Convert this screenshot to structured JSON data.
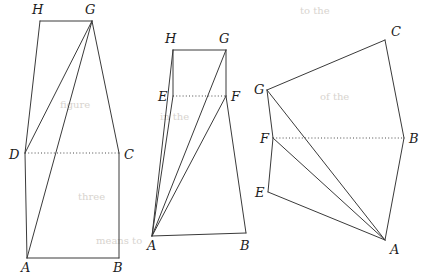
{
  "page": {
    "background_color": "#ffffff",
    "stroke_color": "#3a3a3a",
    "label_color": "#1c1c1c",
    "dotted_color": "#4a4a4a",
    "width": 424,
    "height": 276
  },
  "figures": [
    {
      "id": "figure-left",
      "name": "left-figure",
      "description": "Tall quadrilateral ABGH with horizontal dotted segment DC and diagonals from G",
      "vertices": [
        {
          "id": "H",
          "label": "H",
          "x": 40,
          "y": 21,
          "label_x": 32,
          "label_y": 14
        },
        {
          "id": "G",
          "label": "G",
          "x": 92,
          "y": 21,
          "label_x": 85,
          "label_y": 14
        },
        {
          "id": "D",
          "label": "D",
          "x": 25,
          "y": 153,
          "label_x": 9,
          "label_y": 159
        },
        {
          "id": "C",
          "label": "C",
          "x": 119,
          "y": 153,
          "label_x": 124,
          "label_y": 159
        },
        {
          "id": "A",
          "label": "A",
          "x": 27,
          "y": 258,
          "label_x": 21,
          "label_y": 272
        },
        {
          "id": "B",
          "label": "B",
          "x": 119,
          "y": 258,
          "label_x": 113,
          "label_y": 272
        }
      ],
      "solid_edges": [
        [
          "H",
          "G"
        ],
        [
          "H",
          "D"
        ],
        [
          "G",
          "C"
        ],
        [
          "G",
          "D"
        ],
        [
          "G",
          "A"
        ],
        [
          "D",
          "A"
        ],
        [
          "A",
          "B"
        ],
        [
          "B",
          "C"
        ]
      ],
      "dotted_edges": [
        [
          "D",
          "C"
        ]
      ]
    },
    {
      "id": "figure-middle",
      "name": "middle-figure",
      "description": "Quadrilateral with apex A at bottom-left, rectangle EFGH above, dotted segment EF",
      "vertices": [
        {
          "id": "H",
          "label": "H",
          "x": 173,
          "y": 50,
          "label_x": 165,
          "label_y": 43
        },
        {
          "id": "G",
          "label": "G",
          "x": 226,
          "y": 50,
          "label_x": 219,
          "label_y": 43
        },
        {
          "id": "E",
          "label": "E",
          "x": 173,
          "y": 96,
          "label_x": 158,
          "label_y": 101
        },
        {
          "id": "F",
          "label": "F",
          "x": 226,
          "y": 96,
          "label_x": 231,
          "label_y": 101
        },
        {
          "id": "A",
          "label": "A",
          "x": 152,
          "y": 236,
          "label_x": 147,
          "label_y": 250
        },
        {
          "id": "B",
          "label": "B",
          "x": 246,
          "y": 233,
          "label_x": 240,
          "label_y": 250
        }
      ],
      "solid_edges": [
        [
          "H",
          "G"
        ],
        [
          "H",
          "E"
        ],
        [
          "G",
          "F"
        ],
        [
          "G",
          "A"
        ],
        [
          "H",
          "A"
        ],
        [
          "E",
          "A"
        ],
        [
          "F",
          "A"
        ],
        [
          "F",
          "B"
        ],
        [
          "A",
          "B"
        ]
      ],
      "dotted_edges": [
        [
          "E",
          "F"
        ]
      ]
    },
    {
      "id": "figure-right",
      "name": "right-figure",
      "description": "Rotated polygon with apex A at bottom-right, dotted segment FB, fan of lines from A",
      "vertices": [
        {
          "id": "C",
          "label": "C",
          "x": 385,
          "y": 40,
          "label_x": 391,
          "label_y": 36
        },
        {
          "id": "G",
          "label": "G",
          "x": 267,
          "y": 90,
          "label_x": 254,
          "label_y": 94
        },
        {
          "id": "B",
          "label": "B",
          "x": 404,
          "y": 138,
          "label_x": 409,
          "label_y": 143
        },
        {
          "id": "F",
          "label": "F",
          "x": 273,
          "y": 138,
          "label_x": 260,
          "label_y": 143
        },
        {
          "id": "E",
          "label": "E",
          "x": 268,
          "y": 192,
          "label_x": 255,
          "label_y": 197
        },
        {
          "id": "A",
          "label": "A",
          "x": 385,
          "y": 240,
          "label_x": 390,
          "label_y": 254
        }
      ],
      "solid_edges": [
        [
          "G",
          "C"
        ],
        [
          "C",
          "B"
        ],
        [
          "B",
          "A"
        ],
        [
          "G",
          "F"
        ],
        [
          "F",
          "E"
        ],
        [
          "E",
          "A"
        ],
        [
          "G",
          "A"
        ],
        [
          "F",
          "A"
        ]
      ],
      "dotted_edges": [
        [
          "F",
          "B"
        ]
      ]
    }
  ],
  "background_bleed": [
    {
      "text": "to the",
      "x": 300,
      "y": 14
    },
    {
      "text": "in the",
      "x": 160,
      "y": 120
    },
    {
      "text": "three",
      "x": 78,
      "y": 200
    },
    {
      "text": "means to",
      "x": 96,
      "y": 244
    },
    {
      "text": "of the",
      "x": 320,
      "y": 100
    },
    {
      "text": "figure",
      "x": 60,
      "y": 108
    }
  ]
}
